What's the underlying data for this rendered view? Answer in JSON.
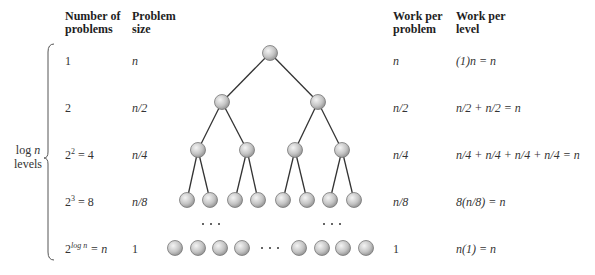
{
  "headers": {
    "num_problems": [
      "Number of",
      "problems"
    ],
    "problem_size": [
      "Problem",
      "size"
    ],
    "work_per_problem": [
      "Work per",
      "problem"
    ],
    "work_per_level": [
      "Work per",
      "level"
    ]
  },
  "side_label": {
    "line1_a": "log ",
    "line1_b": "n",
    "line2": "levels"
  },
  "rows": [
    {
      "num": "1",
      "size": "n",
      "wpp": "n",
      "wpl": "(1)n = n"
    },
    {
      "num": "2",
      "size": "n/2",
      "wpp": "n/2",
      "wpl": "n/2 + n/2 = n"
    },
    {
      "num_base": "2",
      "num_exp": "2",
      "num_rest": " = 4",
      "size": "n/4",
      "wpp": "n/4",
      "wpl": "n/4 + n/4 + n/4 + n/4 = n"
    },
    {
      "num_base": "2",
      "num_exp": "3",
      "num_rest": " = 8",
      "size": "n/8",
      "wpp": "n/8",
      "wpl": "8(n/8) = n"
    },
    {
      "num_base": "2",
      "num_exp": "log n",
      "num_rest": " = n",
      "size": "1",
      "wpp": "1",
      "wpl": "n(1) = n"
    }
  ],
  "tree": {
    "node_fill": "#c8c8c8",
    "edge_color": "#333333",
    "ellipsis": "· · ·"
  }
}
